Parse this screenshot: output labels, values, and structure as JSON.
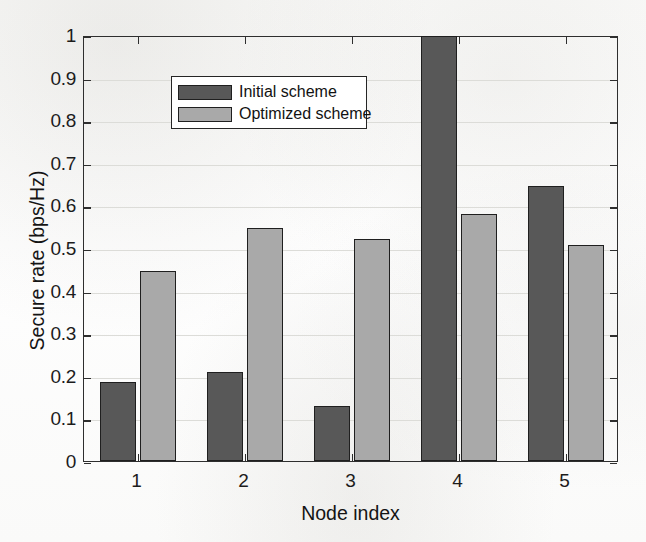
{
  "chart_data": {
    "type": "bar",
    "title": "",
    "xlabel": "Node index",
    "ylabel": "Secure rate (bps/Hz)",
    "categories": [
      "1",
      "2",
      "3",
      "4",
      "5"
    ],
    "series": [
      {
        "name": "Initial scheme",
        "color": "#585858",
        "values": [
          0.185,
          0.208,
          0.128,
          0.998,
          0.645
        ]
      },
      {
        "name": "Optimized scheme",
        "color": "#a9a9a9",
        "values": [
          0.445,
          0.548,
          0.522,
          0.579,
          0.506
        ]
      }
    ],
    "ylim": [
      0,
      1
    ],
    "ytick_labels": [
      "0",
      "0.1",
      "0.2",
      "0.3",
      "0.4",
      "0.5",
      "0.6",
      "0.7",
      "0.8",
      "0.9",
      "1"
    ],
    "ytick_values": [
      0,
      0.1,
      0.2,
      0.3,
      0.4,
      0.5,
      0.6,
      0.7,
      0.8,
      0.9,
      1
    ],
    "grid": true,
    "legend_position": "top-left"
  },
  "legend": {
    "entries": [
      {
        "label": "Initial scheme"
      },
      {
        "label": "Optimized scheme"
      }
    ]
  }
}
